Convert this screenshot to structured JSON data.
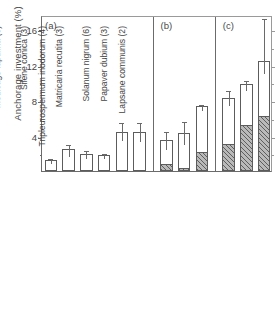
{
  "chart_data": {
    "type": "bar",
    "title": "",
    "xlabel": "",
    "ylabel": "Anchorage investment (%)",
    "ylim": [
      0,
      17.6
    ],
    "yticks": [
      4,
      8,
      12,
      16
    ],
    "ytick_labels": [
      "4",
      "8",
      "12",
      "16"
    ],
    "yminor": [
      2,
      6,
      10,
      14
    ],
    "grid": false,
    "legend": null,
    "panels": [
      {
        "tag": "(a)",
        "species": [
          {
            "label": "Montia perfoliata",
            "n": 6,
            "label_full": "Montia perfoliata (6)",
            "total": 1.25,
            "hatched": 0,
            "err_low": 1.05,
            "err_high": 1.55
          },
          {
            "label": "Vicia hirsuta",
            "n": 6,
            "label_full": "Vicia hirsuta (6)",
            "total": 2.45,
            "hatched": 0,
            "err_low": 1.75,
            "err_high": 3.2
          },
          {
            "label": "Vicia sativa",
            "n": 6,
            "label_full": "Vicia sativa (6)",
            "total": 1.95,
            "hatched": 0,
            "err_low": 1.55,
            "err_high": 2.45
          },
          {
            "label": "Viola tricolor",
            "n": 2,
            "label_full": "Viola tricolor (2)",
            "total": 1.8,
            "hatched": 0,
            "err_low": 1.6,
            "err_high": 2.15
          },
          {
            "label": "Viola arvensis",
            "n": 2,
            "label_full": "Viola arvensis (2)",
            "total": 4.4,
            "hatched": 0,
            "err_low": 3.6,
            "err_high": 5.6
          },
          {
            "label": "Medicago lupulina",
            "n": 6,
            "label_full": "Medicago lupulina (6)",
            "total": 4.4,
            "hatched": 0,
            "err_low": 3.5,
            "err_high": 5.6
          }
        ]
      },
      {
        "tag": "(b)",
        "species": [
          {
            "label": "Silene conica",
            "n": 3,
            "label_full": "Silene conica (3)",
            "total": 3.5,
            "hatched": 0.7,
            "err_low": 2.6,
            "err_high": 4.6
          },
          {
            "label": "Tripleurospermum inodorum",
            "n": 4,
            "label_full": "Tripleurospermum inodorum (4)",
            "total": 4.3,
            "hatched": 0.25,
            "err_low": 3.2,
            "err_high": 5.7
          },
          {
            "label": "Matricaria recutita",
            "n": 3,
            "label_full": "Matricaria recutita (3)",
            "total": 7.3,
            "hatched": 2.0,
            "err_low": 7.0,
            "err_high": 7.7
          }
        ]
      },
      {
        "tag": "(c)",
        "species": [
          {
            "label": "Solanum nigrum",
            "n": 6,
            "label_full": "Solanum nigrum (6)",
            "total": 8.2,
            "hatched": 2.9,
            "err_low": 7.6,
            "err_high": 9.3
          },
          {
            "label": "Papaver dubium",
            "n": 3,
            "label_full": "Papaver dubium (3)",
            "total": 9.8,
            "hatched": 5.1,
            "err_low": 9.3,
            "err_high": 10.4
          },
          {
            "label": "Lapsane communis",
            "n": 2,
            "label_full": "Lapsane communis (2)",
            "total": 12.4,
            "hatched": 6.1,
            "err_low": 11.2,
            "err_high": 17.4
          }
        ]
      }
    ]
  },
  "axis": {
    "ylabel": "Anchorage investment (%)",
    "ytick_labels": [
      "4",
      "8",
      "12",
      "16"
    ]
  },
  "panel_tags": {
    "a": "(a)",
    "b": "(b)",
    "c": "(c)"
  }
}
